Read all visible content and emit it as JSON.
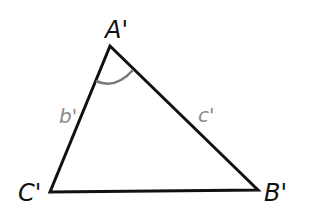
{
  "diagram": {
    "type": "triangle",
    "vertices": {
      "A": {
        "label": "A'",
        "x": 110,
        "y": 46
      },
      "B": {
        "label": "B'",
        "x": 258,
        "y": 190
      },
      "C": {
        "label": "C'",
        "x": 50,
        "y": 192
      }
    },
    "sides": {
      "b": {
        "label": "b'"
      },
      "c": {
        "label": "c'"
      }
    },
    "angle_marker": {
      "at": "A'",
      "color": "#777777"
    },
    "colors": {
      "stroke": "#111111",
      "side_label": "#8a8a8a"
    }
  }
}
